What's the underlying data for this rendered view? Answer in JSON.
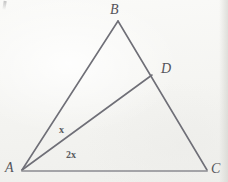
{
  "figure": {
    "kind": "geometry-triangle-diagram",
    "background_color": "#f4f4f1",
    "stroke_color": "#6f6f77",
    "label_color": "#54545a"
  },
  "vertices": {
    "A": {
      "label": "A",
      "x": 22,
      "y": 170
    },
    "B": {
      "label": "B",
      "x": 118,
      "y": 21
    },
    "C": {
      "label": "C",
      "x": 207,
      "y": 170
    },
    "D": {
      "label": "D",
      "x": 152,
      "y": 75
    }
  },
  "segments": [
    {
      "name": "AB",
      "from": "A",
      "to": "B"
    },
    {
      "name": "BC",
      "from": "B",
      "to": "C"
    },
    {
      "name": "AC",
      "from": "A",
      "to": "C"
    },
    {
      "name": "AD",
      "from": "A",
      "to": "D"
    }
  ],
  "angle_labels": [
    {
      "name": "angle-BAD",
      "text": "x",
      "x": 59,
      "y": 125
    },
    {
      "name": "angle-DAC",
      "text": "2x",
      "x": 66,
      "y": 150
    }
  ]
}
